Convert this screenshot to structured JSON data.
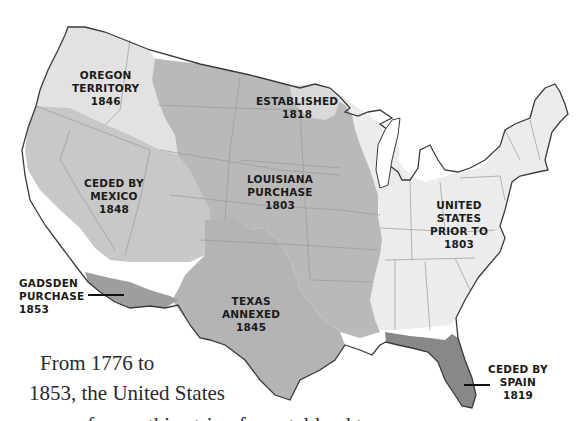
{
  "map": {
    "title": "Territorial Expansion of the United States",
    "colors": {
      "us_prior_1803": "#ececec",
      "oregon_territory": "#e2e2e2",
      "established_1818": "#d6d6d6",
      "louisiana_purchase": "#b9b9b9",
      "ceded_by_mexico": "#c8c8c8",
      "texas_annexed": "#b4b4b4",
      "gadsden_purchase": "#9e9e9e",
      "ceded_by_spain": "#888888",
      "outline": "#3a3a3a",
      "state_lines": "#9a9a9a",
      "label_text": "#1a1a1a"
    },
    "regions": [
      {
        "id": "oregon",
        "lines": [
          "OREGON",
          "TERRITORY",
          "1846"
        ]
      },
      {
        "id": "established",
        "lines": [
          "ESTABLISHED",
          "1818"
        ]
      },
      {
        "id": "louisiana",
        "lines": [
          "LOUISIANA",
          "PURCHASE",
          "1803"
        ]
      },
      {
        "id": "mexico",
        "lines": [
          "CEDED BY",
          "MEXICO",
          "1848"
        ]
      },
      {
        "id": "us_prior",
        "lines": [
          "UNITED",
          "STATES",
          "PRIOR TO",
          "1803"
        ]
      },
      {
        "id": "gadsden",
        "lines": [
          "GADSDEN",
          "PURCHASE",
          "1853"
        ]
      },
      {
        "id": "texas",
        "lines": [
          "TEXAS",
          "ANNEXED",
          "1845"
        ]
      },
      {
        "id": "spain",
        "lines": [
          "CEDED BY",
          "SPAIN",
          "1819"
        ]
      }
    ]
  },
  "caption": {
    "line1": "From 1776 to",
    "line2": "1853, the United States",
    "line3": "grew from a thin strip of coastal land to"
  }
}
